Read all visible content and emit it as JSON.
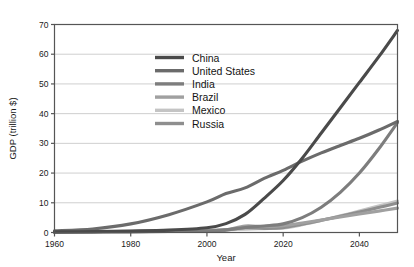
{
  "chart_data": {
    "type": "line",
    "title": "",
    "xlabel": "Year",
    "ylabel": "GDP (trillion $)",
    "xlim": [
      1960,
      2050
    ],
    "ylim": [
      0,
      70
    ],
    "xticks": [
      1960,
      1980,
      2000,
      2020,
      2040
    ],
    "yticks": [
      0,
      10,
      20,
      30,
      40,
      50,
      60,
      70
    ],
    "xtick_labels": [
      "1960",
      "1980",
      "2000",
      "2020",
      "2040"
    ],
    "ytick_labels": [
      "0",
      "10",
      "20",
      "30",
      "40",
      "50",
      "60",
      "70"
    ],
    "grid": "horizontal",
    "legend_position": "upper-center-left",
    "x": [
      1960,
      1970,
      1980,
      1990,
      2000,
      2005,
      2010,
      2015,
      2020,
      2025,
      2030,
      2035,
      2040,
      2045,
      2050
    ],
    "series": [
      {
        "name": "China",
        "color": "#4a4a4a",
        "values": [
          0.2,
          0.3,
          0.5,
          0.8,
          1.6,
          3.0,
          6.1,
          11.5,
          17.5,
          25.0,
          33.5,
          42.0,
          50.5,
          59.0,
          68.0
        ]
      },
      {
        "name": "United States",
        "color": "#6b6b6b",
        "values": [
          0.6,
          1.2,
          2.9,
          6.0,
          10.3,
          13.1,
          15.0,
          18.2,
          20.9,
          24.0,
          26.8,
          29.3,
          31.7,
          34.4,
          37.4
        ]
      },
      {
        "name": "India",
        "color": "#7d7d7d",
        "values": [
          0.1,
          0.15,
          0.2,
          0.35,
          0.5,
          0.9,
          1.7,
          2.2,
          2.9,
          5.0,
          8.5,
          13.5,
          20.0,
          28.0,
          37.0
        ]
      },
      {
        "name": "Brazil",
        "color": "#a0a0a0",
        "values": [
          0.15,
          0.25,
          0.4,
          0.5,
          0.7,
          0.9,
          2.2,
          2.0,
          2.3,
          3.2,
          4.2,
          5.2,
          6.2,
          7.2,
          8.2
        ]
      },
      {
        "name": "Mexico",
        "color": "#c4c4c4",
        "values": [
          0.13,
          0.22,
          0.35,
          0.45,
          0.72,
          0.95,
          1.1,
          1.3,
          1.5,
          2.6,
          4.0,
          5.6,
          7.2,
          8.9,
          10.6
        ]
      },
      {
        "name": "Russia",
        "color": "#8e8e8e",
        "values": [
          0.12,
          0.2,
          0.3,
          0.45,
          0.35,
          0.8,
          1.6,
          1.4,
          1.6,
          2.8,
          4.1,
          5.5,
          6.9,
          8.4,
          9.9
        ]
      }
    ]
  },
  "legend": {
    "items": [
      {
        "label": "China"
      },
      {
        "label": "United States"
      },
      {
        "label": "India"
      },
      {
        "label": "Brazil"
      },
      {
        "label": "Mexico"
      },
      {
        "label": "Russia"
      }
    ]
  },
  "style": {
    "axis_color": "#555555",
    "grid_color": "#cfcfcf",
    "background": "#ffffff"
  }
}
